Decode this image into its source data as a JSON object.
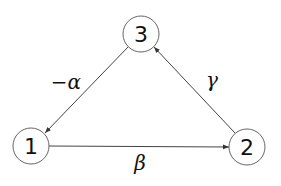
{
  "diagram": {
    "type": "directed-graph",
    "nodes": [
      {
        "id": "1",
        "label": "1",
        "cx": 31,
        "cy": 146,
        "r": 18
      },
      {
        "id": "2",
        "label": "2",
        "cx": 247,
        "cy": 147,
        "r": 18
      },
      {
        "id": "3",
        "label": "3",
        "cx": 141,
        "cy": 34,
        "r": 18
      }
    ],
    "edges": [
      {
        "from": "3",
        "to": "1",
        "label": "−α"
      },
      {
        "from": "1",
        "to": "2",
        "label": "β"
      },
      {
        "from": "2",
        "to": "3",
        "label": "γ"
      }
    ],
    "colors": {
      "node_stroke": "#666666",
      "edge_stroke": "#444444",
      "text": "#111111",
      "background": "#ffffff"
    }
  }
}
